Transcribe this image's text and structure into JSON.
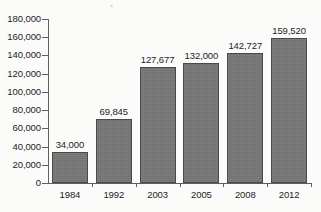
{
  "chart_data": {
    "type": "bar",
    "title": "",
    "subtitle": "",
    "xlabel": "",
    "ylabel": "",
    "categories": [
      "1984",
      "1992",
      "2003",
      "2005",
      "2008",
      "2012"
    ],
    "values": [
      34000,
      69845,
      127677,
      132000,
      142727,
      159520
    ],
    "data_labels": [
      "34,000",
      "69,845",
      "127,677",
      "132,000",
      "142,727",
      "159,520"
    ],
    "ylim": [
      0,
      180000
    ],
    "ytick_step": 20000,
    "ytick_values": [
      0,
      20000,
      40000,
      60000,
      80000,
      100000,
      120000,
      140000,
      160000,
      180000
    ],
    "ytick_labels": [
      "0",
      "20,000",
      "40,000",
      "60,000",
      "80,000",
      "100,000",
      "120,000",
      "140,000",
      "160,000",
      "180,000"
    ],
    "grid": false,
    "legend": false,
    "legend_position": "none",
    "series": [
      {
        "name": "",
        "values": [
          34000,
          69845,
          127677,
          132000,
          142727,
          159520
        ]
      }
    ],
    "colors": {
      "bar_fill": "#757575",
      "bar_border": "#4a4a4a",
      "axis": "#5f5f5f",
      "text": "#242424",
      "background": "#fbfbfa"
    }
  }
}
